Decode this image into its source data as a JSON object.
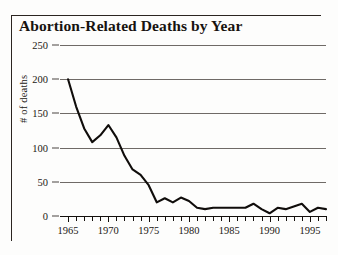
{
  "figure": {
    "title": "Abortion-Related Deaths by Year"
  },
  "chart_data": {
    "type": "line",
    "title": "Abortion-Related Deaths by Year",
    "xlabel": "",
    "ylabel": "# of deaths",
    "xlim": [
      1964,
      1997
    ],
    "ylim": [
      0,
      250
    ],
    "grid": true,
    "legend": null,
    "y_ticks": [
      0,
      50,
      100,
      150,
      200,
      250
    ],
    "y_tick_labels": [
      "0",
      "50",
      "100",
      "150",
      "200",
      "250"
    ],
    "x_tick_labels": [
      "1965",
      "1970",
      "1975",
      "1980",
      "1985",
      "1990",
      "1995"
    ],
    "x_tick_label_years": [
      1965,
      1970,
      1975,
      1980,
      1985,
      1990,
      1995
    ],
    "x_minor_tick_interval": 1,
    "series": [
      {
        "name": "# of deaths",
        "color": "#100d0b",
        "x": [
          1965,
          1966,
          1967,
          1968,
          1969,
          1970,
          1971,
          1972,
          1973,
          1974,
          1975,
          1976,
          1977,
          1978,
          1979,
          1980,
          1981,
          1982,
          1983,
          1984,
          1985,
          1986,
          1987,
          1988,
          1989,
          1990,
          1991,
          1992,
          1993,
          1994,
          1995,
          1996,
          1997
        ],
        "values": [
          200,
          160,
          128,
          108,
          118,
          133,
          115,
          88,
          68,
          60,
          45,
          20,
          26,
          20,
          27,
          22,
          12,
          10,
          12,
          12,
          12,
          12,
          12,
          18,
          10,
          4,
          12,
          10,
          14,
          18,
          6,
          12,
          10
        ]
      }
    ]
  }
}
